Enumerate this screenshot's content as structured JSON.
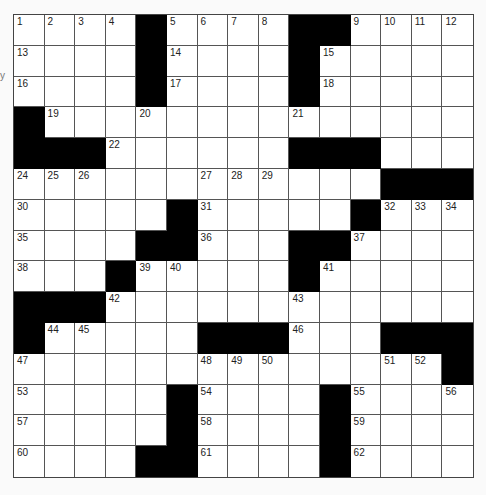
{
  "puzzle": {
    "rows": 15,
    "cols": 15,
    "colors": {
      "block": "#000000",
      "cell": "#ffffff",
      "line": "#555555"
    },
    "layout": [
      "....#....##....",
      "....#....#.....",
      "....#....#.....",
      "#..............",
      "###......###...#",
      "............###",
      ".....#.....#...",
      "....##...##....",
      "...#.....#.....",
      "###............",
      "#.....###...###",
      "..............#",
      ".....#....#....",
      ".....#....#....",
      "....##....#...."
    ],
    "numbers": [
      {
        "r": 0,
        "c": 0,
        "n": "1"
      },
      {
        "r": 0,
        "c": 1,
        "n": "2"
      },
      {
        "r": 0,
        "c": 2,
        "n": "3"
      },
      {
        "r": 0,
        "c": 3,
        "n": "4"
      },
      {
        "r": 0,
        "c": 5,
        "n": "5"
      },
      {
        "r": 0,
        "c": 6,
        "n": "6"
      },
      {
        "r": 0,
        "c": 7,
        "n": "7"
      },
      {
        "r": 0,
        "c": 8,
        "n": "8"
      },
      {
        "r": 0,
        "c": 11,
        "n": "9"
      },
      {
        "r": 0,
        "c": 12,
        "n": "10"
      },
      {
        "r": 0,
        "c": 13,
        "n": "11"
      },
      {
        "r": 0,
        "c": 14,
        "n": "12"
      },
      {
        "r": 1,
        "c": 0,
        "n": "13"
      },
      {
        "r": 1,
        "c": 5,
        "n": "14"
      },
      {
        "r": 1,
        "c": 10,
        "n": "15"
      },
      {
        "r": 2,
        "c": 0,
        "n": "16"
      },
      {
        "r": 2,
        "c": 5,
        "n": "17"
      },
      {
        "r": 2,
        "c": 10,
        "n": "18"
      },
      {
        "r": 3,
        "c": 1,
        "n": "19"
      },
      {
        "r": 3,
        "c": 4,
        "n": "20"
      },
      {
        "r": 3,
        "c": 9,
        "n": "21"
      },
      {
        "r": 4,
        "c": 3,
        "n": "22"
      },
      {
        "r": 4,
        "c": 9,
        "n": "23"
      },
      {
        "r": 5,
        "c": 0,
        "n": "24"
      },
      {
        "r": 5,
        "c": 1,
        "n": "25"
      },
      {
        "r": 5,
        "c": 2,
        "n": "26"
      },
      {
        "r": 5,
        "c": 6,
        "n": "27"
      },
      {
        "r": 5,
        "c": 7,
        "n": "28"
      },
      {
        "r": 5,
        "c": 8,
        "n": "29"
      },
      {
        "r": 6,
        "c": 0,
        "n": "30"
      },
      {
        "r": 6,
        "c": 6,
        "n": "31"
      },
      {
        "r": 6,
        "c": 12,
        "n": "32"
      },
      {
        "r": 6,
        "c": 13,
        "n": "33"
      },
      {
        "r": 6,
        "c": 14,
        "n": "34"
      },
      {
        "r": 7,
        "c": 0,
        "n": "35"
      },
      {
        "r": 7,
        "c": 6,
        "n": "36"
      },
      {
        "r": 7,
        "c": 11,
        "n": "37"
      },
      {
        "r": 8,
        "c": 0,
        "n": "38"
      },
      {
        "r": 8,
        "c": 4,
        "n": "39"
      },
      {
        "r": 8,
        "c": 5,
        "n": "40"
      },
      {
        "r": 8,
        "c": 10,
        "n": "41"
      },
      {
        "r": 9,
        "c": 3,
        "n": "42"
      },
      {
        "r": 9,
        "c": 9,
        "n": "43"
      },
      {
        "r": 10,
        "c": 1,
        "n": "44"
      },
      {
        "r": 10,
        "c": 2,
        "n": "45"
      },
      {
        "r": 10,
        "c": 9,
        "n": "46"
      },
      {
        "r": 11,
        "c": 0,
        "n": "47"
      },
      {
        "r": 11,
        "c": 6,
        "n": "48"
      },
      {
        "r": 11,
        "c": 7,
        "n": "49"
      },
      {
        "r": 11,
        "c": 8,
        "n": "50"
      },
      {
        "r": 11,
        "c": 12,
        "n": "51"
      },
      {
        "r": 11,
        "c": 13,
        "n": "52"
      },
      {
        "r": 12,
        "c": 0,
        "n": "53"
      },
      {
        "r": 12,
        "c": 6,
        "n": "54"
      },
      {
        "r": 12,
        "c": 11,
        "n": "55"
      },
      {
        "r": 12,
        "c": 14,
        "n": "56"
      },
      {
        "r": 13,
        "c": 0,
        "n": "57"
      },
      {
        "r": 13,
        "c": 6,
        "n": "58"
      },
      {
        "r": 13,
        "c": 11,
        "n": "59"
      },
      {
        "r": 14,
        "c": 0,
        "n": "60"
      },
      {
        "r": 14,
        "c": 6,
        "n": "61"
      },
      {
        "r": 14,
        "c": 11,
        "n": "62"
      }
    ]
  },
  "stray_mark": "y"
}
